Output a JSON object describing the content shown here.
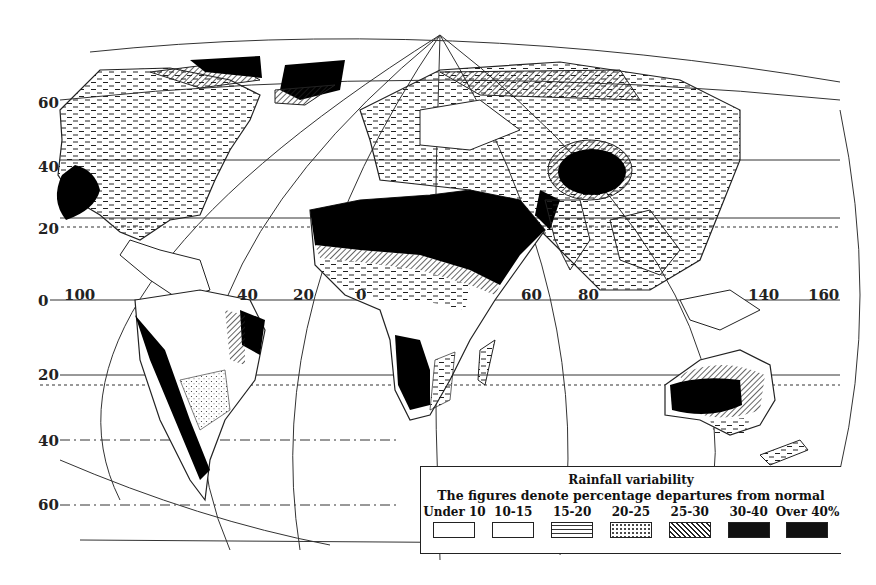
{
  "map": {
    "title": "Rainfall variability",
    "subtitle": "The figures denote percentage departures from normal",
    "latitude_labels": [
      {
        "text": "60",
        "x": 38,
        "y": 102
      },
      {
        "text": "40",
        "x": 38,
        "y": 162
      },
      {
        "text": "20",
        "x": 38,
        "y": 220
      },
      {
        "text": "0",
        "x": 38,
        "y": 298
      },
      {
        "text": "20",
        "x": 38,
        "y": 372
      },
      {
        "text": "40",
        "x": 38,
        "y": 432
      },
      {
        "text": "60",
        "x": 38,
        "y": 498
      }
    ],
    "longitude_labels": [
      {
        "text": "100",
        "x": 64,
        "y": 283
      },
      {
        "text": "40",
        "x": 237,
        "y": 283
      },
      {
        "text": "20",
        "x": 293,
        "y": 283
      },
      {
        "text": "0",
        "x": 356,
        "y": 283
      },
      {
        "text": "60",
        "x": 521,
        "y": 283
      },
      {
        "text": "80",
        "x": 578,
        "y": 283
      },
      {
        "text": "140",
        "x": 748,
        "y": 283
      },
      {
        "text": "160",
        "x": 808,
        "y": 283
      }
    ],
    "legend": {
      "items": [
        {
          "label": "Under 10",
          "pattern": "blank"
        },
        {
          "label": "10-15",
          "pattern": "blank"
        },
        {
          "label": "15-20",
          "pattern": "dashes"
        },
        {
          "label": "20-25",
          "pattern": "stipple"
        },
        {
          "label": "25-30",
          "pattern": "hatch"
        },
        {
          "label": "30-40",
          "pattern": "solid"
        },
        {
          "label": "Over 40%",
          "pattern": "solid"
        }
      ]
    },
    "colors": {
      "ink": "#111111",
      "paper": "#ffffff"
    }
  }
}
